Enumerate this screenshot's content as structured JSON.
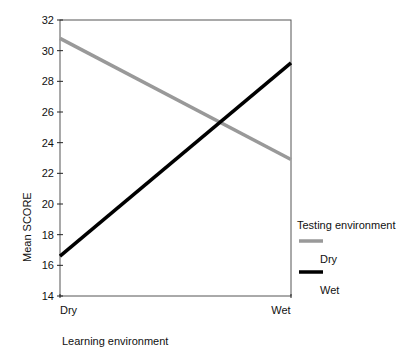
{
  "chart_data": {
    "type": "line",
    "title": "",
    "xlabel": "Learning environment",
    "ylabel": "Mean SCORE",
    "categories": [
      "Dry",
      "Wet"
    ],
    "series": [
      {
        "name": "Dry",
        "color": "#999999",
        "values": [
          30.8,
          22.9
        ]
      },
      {
        "name": "Wet",
        "color": "#000000",
        "values": [
          16.6,
          29.2
        ]
      }
    ],
    "ylim": [
      14,
      32
    ],
    "yticks": [
      14,
      16,
      18,
      20,
      22,
      24,
      26,
      28,
      30,
      32
    ],
    "grid": false,
    "legend": {
      "title": "Testing environment",
      "position": "right"
    }
  }
}
